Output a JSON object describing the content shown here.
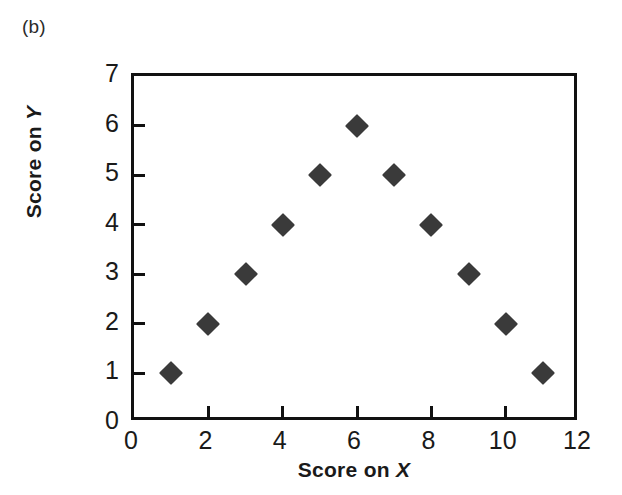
{
  "panel": {
    "label": "(b)"
  },
  "axes": {
    "x_title_prefix": "Score on ",
    "x_variable": "X",
    "y_title_prefix": "Score on ",
    "y_variable": "Y",
    "x_ticks": [
      "0",
      "2",
      "4",
      "6",
      "8",
      "10",
      "12"
    ],
    "y_ticks": [
      "0",
      "1",
      "2",
      "3",
      "4",
      "5",
      "6",
      "7"
    ]
  },
  "style": {
    "marker_color": "#3a3a3a",
    "axis_color": "#111111",
    "background": "#ffffff"
  },
  "chart_data": {
    "type": "scatter",
    "title": "(b)",
    "xlabel": "Score on X",
    "ylabel": "Score on Y",
    "xlim": [
      0,
      12
    ],
    "ylim": [
      0,
      7
    ],
    "xticks": [
      0,
      2,
      4,
      6,
      8,
      10,
      12
    ],
    "yticks": [
      0,
      1,
      2,
      3,
      4,
      5,
      6,
      7
    ],
    "grid": false,
    "legend": null,
    "marker": "filled-diamond",
    "points": [
      {
        "x": 1,
        "y": 1
      },
      {
        "x": 2,
        "y": 2
      },
      {
        "x": 3,
        "y": 3
      },
      {
        "x": 4,
        "y": 4
      },
      {
        "x": 5,
        "y": 5
      },
      {
        "x": 6,
        "y": 6
      },
      {
        "x": 7,
        "y": 5
      },
      {
        "x": 8,
        "y": 4
      },
      {
        "x": 9,
        "y": 3
      },
      {
        "x": 10,
        "y": 2
      },
      {
        "x": 11,
        "y": 1
      }
    ],
    "x": [
      1,
      2,
      3,
      4,
      5,
      6,
      7,
      8,
      9,
      10,
      11
    ],
    "values": [
      1,
      2,
      3,
      4,
      5,
      6,
      5,
      4,
      3,
      2,
      1
    ],
    "annotations": []
  }
}
